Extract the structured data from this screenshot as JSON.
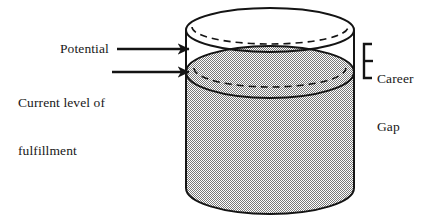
{
  "diagram": {
    "type": "annotated-illustration",
    "labels": {
      "potential": "Potential",
      "current_level_line1": "Current level of",
      "current_level_line2": "fulfillment",
      "career_gap_line1": "Career",
      "career_gap_line2": "Gap"
    },
    "shape": {
      "name": "cylinder",
      "fill_label": "Current level of fulfillment",
      "empty_label": "Career Gap",
      "fill_color": "#a9a9a9",
      "empty_color": "#ffffff",
      "outline_color": "#141414"
    },
    "annotations": [
      {
        "name": "potential-arrow",
        "points_to": "top rim of cylinder",
        "style": "solid arrow"
      },
      {
        "name": "current-level-arrow",
        "points_to": "fill surface of cylinder",
        "style": "solid arrow"
      },
      {
        "name": "career-gap-bracket",
        "spans": "between fill surface and top rim",
        "style": "right bracket"
      }
    ],
    "colors": {
      "ink": "#141414",
      "fill_gray": "#a9a9a9",
      "background": "#ffffff"
    }
  }
}
